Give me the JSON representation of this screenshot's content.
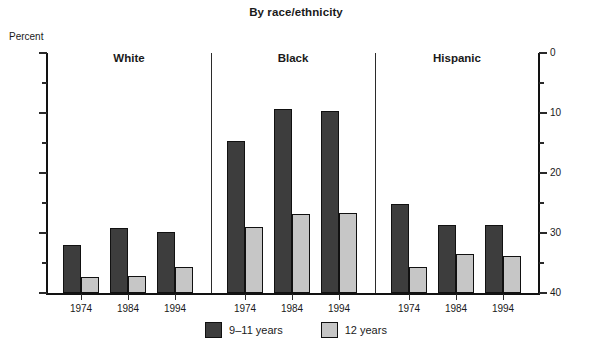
{
  "chart_data": {
    "type": "bar",
    "title": "By race/ethnicity",
    "ylabel": "Percent",
    "xlabel": "",
    "ylim": [
      0,
      40
    ],
    "yticks": [
      0,
      10,
      20,
      30,
      40
    ],
    "yticks_minor": [
      5,
      15,
      25,
      35
    ],
    "grid": false,
    "dual_axis": true,
    "legend_position": "bottom-center",
    "group_labels": [
      "White",
      "Black",
      "Hispanic"
    ],
    "categories": [
      "1974",
      "1984",
      "1994"
    ],
    "series": [
      {
        "name": "9–11 years",
        "color": "#3d3d3d",
        "values_by_group": {
          "White": [
            8.0,
            10.8,
            10.2
          ],
          "Black": [
            25.4,
            30.7,
            30.4
          ],
          "Hispanic": [
            14.9,
            11.4,
            11.4
          ]
        }
      },
      {
        "name": "12 years",
        "color": "#c6c6c6",
        "values_by_group": {
          "White": [
            2.6,
            2.9,
            4.4
          ],
          "Black": [
            11.0,
            13.2,
            13.4
          ],
          "Hispanic": [
            4.4,
            6.5,
            6.2
          ]
        }
      }
    ]
  },
  "axis": {
    "unit_label": "Percent",
    "left_tick_labels": [
      "40",
      "30",
      "20",
      "10",
      "0"
    ],
    "right_tick_labels": [
      "40",
      "30",
      "20",
      "10",
      "0"
    ]
  },
  "legend": {
    "items": [
      {
        "label": "9–11 years"
      },
      {
        "label": "12 years"
      }
    ]
  }
}
